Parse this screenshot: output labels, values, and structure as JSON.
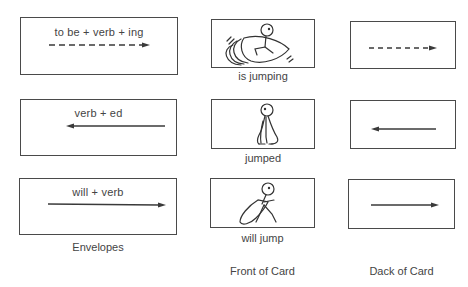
{
  "columns": {
    "envelopes": "Envelopes",
    "front": "Front of Card",
    "back": "Dack of Card"
  },
  "rows": [
    {
      "envelope_text": "to be + verb + ing",
      "arrow_style": "dashed",
      "arrow_direction": "right",
      "front_caption": "is jumping",
      "front_icon": "stick-figure-jumping-icon"
    },
    {
      "envelope_text": "verb + ed",
      "arrow_style": "solid",
      "arrow_direction": "left",
      "front_caption": "jumped",
      "front_icon": "stick-figure-landed-icon"
    },
    {
      "envelope_text": "will + verb",
      "arrow_style": "solid",
      "arrow_direction": "right",
      "front_caption": "will jump",
      "front_icon": "stick-figure-crouching-icon"
    }
  ],
  "colors": {
    "line": "#3a3a3a",
    "text": "#444444",
    "background": "#ffffff"
  }
}
